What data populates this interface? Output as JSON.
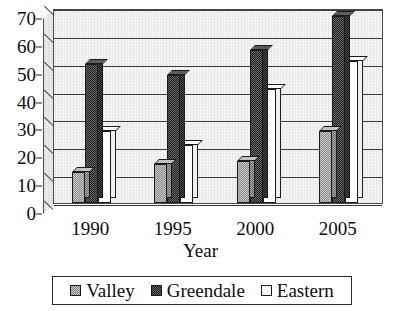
{
  "chart_data": {
    "type": "bar",
    "title": "",
    "xlabel": "Year",
    "ylabel": "",
    "categories": [
      "1990",
      "1995",
      "2000",
      "2005"
    ],
    "series": [
      {
        "name": "Valley",
        "values": [
          11,
          14,
          15,
          26
        ],
        "fill": "light-checkered",
        "color": "#b0b0b0"
      },
      {
        "name": "Greendale",
        "values": [
          50,
          46,
          55,
          67
        ],
        "fill": "dark-checkered",
        "color": "#3a3a3a"
      },
      {
        "name": "Eastern",
        "values": [
          26,
          21,
          41,
          51
        ],
        "fill": "white",
        "color": "#ffffff"
      }
    ],
    "ylim": [
      0,
      70
    ],
    "yticks": [
      0,
      10,
      20,
      30,
      40,
      50,
      60,
      70
    ],
    "grid": true,
    "legend_position": "bottom",
    "style": "3d-clustered-column"
  },
  "axis": {
    "y_labels": [
      "70",
      "60",
      "50",
      "40",
      "30",
      "20",
      "10",
      "0"
    ],
    "x_labels": [
      "1990",
      "1995",
      "2000",
      "2005"
    ],
    "x_title": "Year"
  },
  "legend": {
    "entries": [
      {
        "label": "Valley",
        "swatch": "legend-swatch-valley"
      },
      {
        "label": "Greendale",
        "swatch": "legend-swatch-greendale"
      },
      {
        "label": "Eastern",
        "swatch": "legend-swatch-eastern"
      }
    ]
  }
}
